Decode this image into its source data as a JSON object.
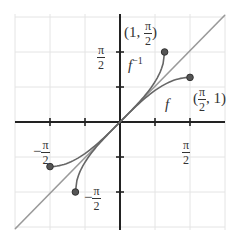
{
  "figure": {
    "type": "function-and-inverse-plot",
    "colors": {
      "axis": "#222222",
      "grid": "#e4e4e4",
      "diagonal": "#9a9a9a",
      "curve": "#666666",
      "dot_fill": "#555555",
      "text": "#333333"
    },
    "labels": {
      "f": "f",
      "f_inverse_base": "f",
      "f_inverse_sup": "−1",
      "point_upper_open": "(1, ",
      "point_upper_num": "π",
      "point_upper_den": "2",
      "point_upper_close": ")",
      "point_right_open": "(",
      "point_right_num": "π",
      "point_right_den": "2",
      "point_right_close": ", 1)",
      "y_tick_pos_num": "π",
      "y_tick_pos_den": "2",
      "x_tick_pos_num": "π",
      "x_tick_pos_den": "2",
      "x_tick_neg_sign": "−",
      "x_tick_neg_num": "π",
      "x_tick_neg_den": "2",
      "y_tick_neg_sign": "−",
      "y_tick_neg_num": "π",
      "y_tick_neg_den": "2"
    }
  },
  "chart_data": {
    "type": "line",
    "title": "",
    "xlabel": "",
    "ylabel": "",
    "xlim": [
      -2.4,
      2.4
    ],
    "ylim": [
      -2.4,
      2.4
    ],
    "grid": true,
    "series": [
      {
        "name": "f",
        "description": "sin(x) on [-π/2, π/2]",
        "endpoints": [
          [
            -1.5708,
            -1
          ],
          [
            1.5708,
            1
          ]
        ]
      },
      {
        "name": "f^-1",
        "description": "arcsin(x) on [-1, 1]",
        "endpoints": [
          [
            -1,
            -1.5708
          ],
          [
            1,
            1.5708
          ]
        ]
      },
      {
        "name": "y = x",
        "description": "line of reflection"
      }
    ],
    "marked_points": [
      [
        1,
        1.5708
      ],
      [
        1.5708,
        1
      ],
      [
        -1.5708,
        -1
      ],
      [
        -1,
        -1.5708
      ]
    ],
    "annotations": [
      "(1, π/2)",
      "(π/2, 1)",
      "π/2",
      "−π/2",
      "f",
      "f^-1"
    ]
  }
}
